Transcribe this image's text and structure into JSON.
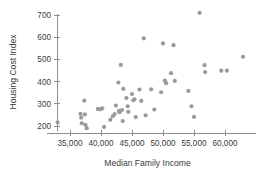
{
  "chart_data": {
    "type": "scatter",
    "title": "",
    "xlabel": "Median Family Income",
    "ylabel": "Housing Cost Index",
    "xlim": [
      32000,
      64500
    ],
    "ylim": [
      180,
      730
    ],
    "grid": false,
    "legend": null,
    "xticks": [
      35000,
      40000,
      45000,
      50000,
      55000,
      60000
    ],
    "xtick_labels": [
      "35,000",
      "40,000",
      "45,000",
      "50,000",
      "55,000",
      "60,000"
    ],
    "yticks": [
      200,
      300,
      400,
      500,
      600,
      700
    ],
    "ytick_labels": [
      "200",
      "300",
      "400",
      "500",
      "600",
      "700"
    ],
    "marker_color": "#9a9a9a",
    "marker_size": 2.1,
    "points": [
      {
        "x": 33000,
        "y": 216
      },
      {
        "x": 36700,
        "y": 255
      },
      {
        "x": 36800,
        "y": 238
      },
      {
        "x": 36900,
        "y": 212
      },
      {
        "x": 37300,
        "y": 314
      },
      {
        "x": 37400,
        "y": 252
      },
      {
        "x": 37500,
        "y": 205
      },
      {
        "x": 37700,
        "y": 190
      },
      {
        "x": 39500,
        "y": 277
      },
      {
        "x": 39900,
        "y": 275
      },
      {
        "x": 40200,
        "y": 280
      },
      {
        "x": 40500,
        "y": 196
      },
      {
        "x": 41500,
        "y": 228
      },
      {
        "x": 41900,
        "y": 244
      },
      {
        "x": 42200,
        "y": 254
      },
      {
        "x": 42400,
        "y": 292
      },
      {
        "x": 42800,
        "y": 396
      },
      {
        "x": 42900,
        "y": 268
      },
      {
        "x": 43000,
        "y": 262
      },
      {
        "x": 43200,
        "y": 475
      },
      {
        "x": 43400,
        "y": 272
      },
      {
        "x": 43500,
        "y": 222
      },
      {
        "x": 43600,
        "y": 367
      },
      {
        "x": 44100,
        "y": 326
      },
      {
        "x": 44300,
        "y": 289
      },
      {
        "x": 44400,
        "y": 264
      },
      {
        "x": 45000,
        "y": 344
      },
      {
        "x": 45200,
        "y": 316
      },
      {
        "x": 45400,
        "y": 320
      },
      {
        "x": 45600,
        "y": 240
      },
      {
        "x": 46200,
        "y": 364
      },
      {
        "x": 46500,
        "y": 313
      },
      {
        "x": 46900,
        "y": 595
      },
      {
        "x": 47200,
        "y": 248
      },
      {
        "x": 48100,
        "y": 365
      },
      {
        "x": 48600,
        "y": 274
      },
      {
        "x": 49700,
        "y": 352
      },
      {
        "x": 50000,
        "y": 572
      },
      {
        "x": 50300,
        "y": 404
      },
      {
        "x": 50500,
        "y": 393
      },
      {
        "x": 51300,
        "y": 438
      },
      {
        "x": 51700,
        "y": 564
      },
      {
        "x": 51900,
        "y": 403
      },
      {
        "x": 54100,
        "y": 358
      },
      {
        "x": 54600,
        "y": 289
      },
      {
        "x": 55000,
        "y": 241
      },
      {
        "x": 55900,
        "y": 710
      },
      {
        "x": 56700,
        "y": 474
      },
      {
        "x": 56800,
        "y": 443
      },
      {
        "x": 59400,
        "y": 449
      },
      {
        "x": 60300,
        "y": 449
      },
      {
        "x": 62900,
        "y": 512
      }
    ]
  }
}
